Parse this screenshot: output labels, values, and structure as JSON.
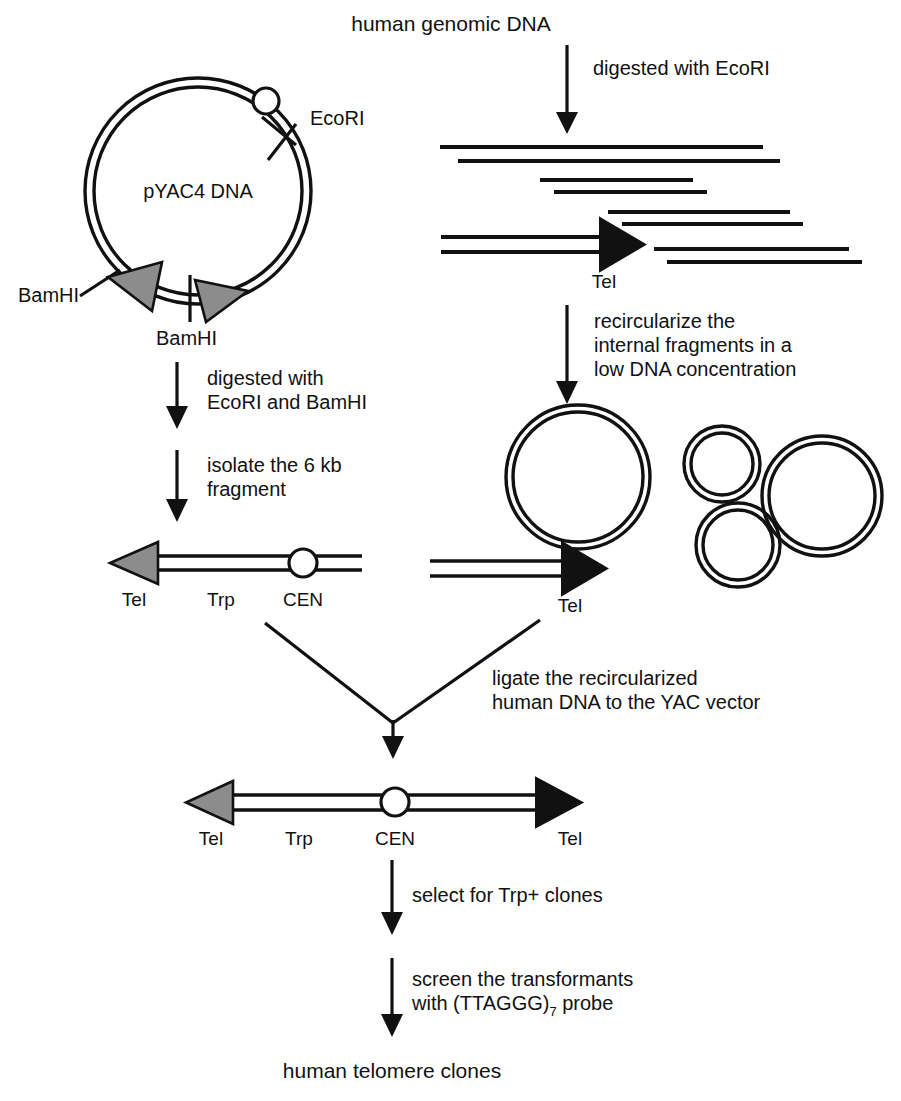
{
  "figure": {
    "domain": "diagram",
    "background_color": "#ffffff",
    "line_color": "#111111",
    "telomere_gray": "#8c8c8c",
    "telomere_black": "#111111"
  },
  "labels": {
    "human_genomic_dna": "human genomic DNA",
    "digested_with_ecori": "digested with EcoRI",
    "plasmid_name": "pYAC4 DNA",
    "ecori_site": "EcoRI",
    "bamhi_site_left": "BamHI",
    "bamhi_site_bottom": "BamHI",
    "tel_fragment_top": "Tel",
    "recircularize_line1": "recircularize the",
    "recircularize_line2": "internal fragments in a",
    "recircularize_line3": "low DNA concentration",
    "digested_ecori_bamhi_line1": "digested with",
    "digested_ecori_bamhi_line2": "EcoRI and BamHI",
    "isolate_line1": "isolate the 6 kb",
    "isolate_line2": "fragment",
    "arm_left_tel": "Tel",
    "arm_left_trp": "Trp",
    "arm_left_cen": "CEN",
    "arm_right_tel": "Tel",
    "ligate_line1": "ligate the recircularized",
    "ligate_line2": "human DNA to the YAC vector",
    "yac_tel_left": "Tel",
    "yac_trp": "Trp",
    "yac_cen": "CEN",
    "yac_tel_right": "Tel",
    "select_trp": "select for Trp+ clones",
    "screen_line1": "screen the transformants",
    "screen_line2_pre": "with (TTAGGG)",
    "screen_line2_sub": "7",
    "screen_line2_post": " probe",
    "human_telomere_clones": "human telomere clones"
  },
  "diagram_data": {
    "type": "flowchart",
    "plasmid": {
      "center_x": 198,
      "center_y": 191,
      "outer_radius": 113,
      "inner_radius": 104,
      "cen_marker": "open-circle",
      "sites": [
        "EcoRI",
        "BamHI",
        "BamHI"
      ],
      "telomere_arrows": 2
    },
    "genomic_fragments": [
      {
        "x1": 440,
        "x2": 763,
        "y": 147
      },
      {
        "x1": 458,
        "x2": 780,
        "y": 161
      },
      {
        "x1": 540,
        "x2": 693,
        "y": 180
      },
      {
        "x1": 554,
        "x2": 707,
        "y": 192
      },
      {
        "x1": 608,
        "x2": 790,
        "y": 212
      },
      {
        "x1": 622,
        "x2": 803,
        "y": 224
      },
      {
        "x1": 654,
        "x2": 849,
        "y": 249
      },
      {
        "x1": 667,
        "x2": 862,
        "y": 262
      }
    ],
    "recircularized_circles": [
      {
        "cx": 578,
        "cy": 477,
        "r": 72
      },
      {
        "cx": 722,
        "cy": 464,
        "r": 38
      },
      {
        "cx": 822,
        "cy": 496,
        "r": 60
      },
      {
        "cx": 738,
        "cy": 545,
        "r": 42
      }
    ],
    "steps": [
      "human genomic DNA",
      "digested with EcoRI",
      "recircularize the internal fragments in a low DNA concentration",
      "digested with EcoRI and BamHI",
      "isolate the 6 kb fragment",
      "ligate the recircularized human DNA to the YAC vector",
      "select for Trp+ clones",
      "screen the transformants with (TTAGGG)7 probe",
      "human telomere clones"
    ]
  }
}
